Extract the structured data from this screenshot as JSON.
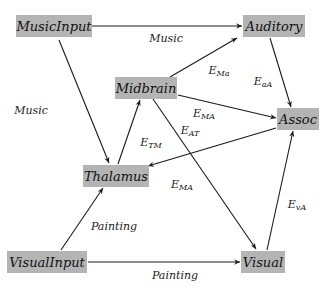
{
  "diagram": {
    "type": "directed-graph",
    "colors": {
      "node_fill": "#b4b4b4",
      "edge": "#1a1a1a",
      "background": "#ffffff"
    },
    "nodes": [
      {
        "id": "musicinput",
        "label": "MusicInput",
        "x": 54,
        "y": 26,
        "w": 76,
        "h": 22
      },
      {
        "id": "auditory",
        "label": "Auditory",
        "x": 274,
        "y": 26,
        "w": 62,
        "h": 22
      },
      {
        "id": "midbrain",
        "label": "Midbrain",
        "x": 146,
        "y": 88,
        "w": 62,
        "h": 22
      },
      {
        "id": "assoc",
        "label": "Assoc",
        "x": 298,
        "y": 119,
        "w": 42,
        "h": 22
      },
      {
        "id": "thalamus",
        "label": "Thalamus",
        "x": 116,
        "y": 176,
        "w": 66,
        "h": 22
      },
      {
        "id": "visualinput",
        "label": "VisualInput",
        "x": 47,
        "y": 262,
        "w": 80,
        "h": 22
      },
      {
        "id": "visual",
        "label": "Visual",
        "x": 263,
        "y": 262,
        "w": 44,
        "h": 22
      }
    ],
    "edges": [
      {
        "id": "musicinput-auditory",
        "from": "musicinput",
        "to": "auditory",
        "label": "Music",
        "sub": "",
        "x1": 92,
        "y1": 26,
        "x2": 242,
        "y2": 26,
        "lx": 166,
        "ly": 38
      },
      {
        "id": "musicinput-thalamus",
        "from": "musicinput",
        "to": "thalamus",
        "label": "Music",
        "sub": "",
        "x1": 59,
        "y1": 40,
        "x2": 109,
        "y2": 163,
        "lx": 31,
        "ly": 110
      },
      {
        "id": "midbrain-auditory",
        "from": "midbrain",
        "to": "auditory",
        "label": "E",
        "sub": "Ma",
        "x1": 170,
        "y1": 77,
        "x2": 237,
        "y2": 38,
        "lx": 219,
        "ly": 70
      },
      {
        "id": "midbrain-assoc",
        "from": "midbrain",
        "to": "assoc",
        "label": "E",
        "sub": "MA",
        "x1": 178,
        "y1": 95,
        "x2": 276,
        "y2": 118,
        "lx": 204,
        "ly": 113
      },
      {
        "id": "midbrain-visual",
        "from": "midbrain",
        "to": "visual",
        "label": "E",
        "sub": "MA",
        "x1": 153,
        "y1": 99,
        "x2": 256,
        "y2": 249,
        "lx": 182,
        "ly": 184
      },
      {
        "id": "auditory-assoc",
        "from": "auditory",
        "to": "assoc",
        "label": "E",
        "sub": "aA",
        "x1": 270,
        "y1": 38,
        "x2": 291,
        "y2": 107,
        "lx": 263,
        "ly": 81
      },
      {
        "id": "assoc-thalamus",
        "from": "assoc",
        "to": "thalamus",
        "label": "E",
        "sub": "AT",
        "x1": 276,
        "y1": 128,
        "x2": 148,
        "y2": 166,
        "lx": 190,
        "ly": 130
      },
      {
        "id": "thalamus-midbrain",
        "from": "thalamus",
        "to": "midbrain",
        "label": "E",
        "sub": "TM",
        "x1": 118,
        "y1": 164,
        "x2": 140,
        "y2": 100,
        "lx": 151,
        "ly": 142
      },
      {
        "id": "visualinput-thalamus",
        "from": "visualinput",
        "to": "thalamus",
        "label": "Painting",
        "sub": "",
        "x1": 61,
        "y1": 250,
        "x2": 103,
        "y2": 188,
        "lx": 114,
        "ly": 226
      },
      {
        "id": "visualinput-visual",
        "from": "visualinput",
        "to": "visual",
        "label": "Painting",
        "sub": "",
        "x1": 88,
        "y1": 262,
        "x2": 240,
        "y2": 262,
        "lx": 175,
        "ly": 275
      },
      {
        "id": "visual-assoc",
        "from": "visual",
        "to": "assoc",
        "label": "E",
        "sub": "vA",
        "x1": 267,
        "y1": 250,
        "x2": 293,
        "y2": 131,
        "lx": 297,
        "ly": 204
      }
    ]
  }
}
